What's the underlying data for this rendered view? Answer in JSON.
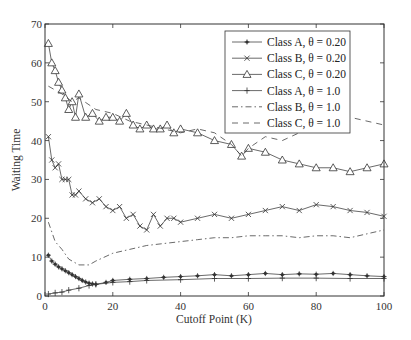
{
  "chart_data": {
    "type": "line",
    "title": "",
    "xlabel": "Cutoff Point (K)",
    "ylabel": "Waiting Time",
    "xlim": [
      0,
      100
    ],
    "ylim": [
      0,
      70
    ],
    "xticks": [
      0,
      20,
      40,
      60,
      80,
      100
    ],
    "yticks": [
      0,
      10,
      20,
      30,
      40,
      50,
      60,
      70
    ],
    "grid": false,
    "legend_position": "upper right (inside)",
    "series": [
      {
        "name": "Class A, θ = 0.20",
        "marker": "asterisk",
        "linestyle": "solid",
        "x": [
          1,
          2,
          3,
          4,
          5,
          6,
          7,
          8,
          9,
          10,
          11,
          12,
          13,
          14,
          15,
          18,
          20,
          25,
          30,
          35,
          40,
          45,
          50,
          55,
          60,
          65,
          70,
          75,
          80,
          85,
          90,
          95,
          100
        ],
        "values": [
          10.5,
          9,
          8.2,
          7.5,
          7,
          6.5,
          6,
          5.5,
          5,
          4.5,
          4,
          3.6,
          3.3,
          3.1,
          3,
          3.5,
          4,
          4.3,
          4.5,
          4.8,
          5,
          5.2,
          5.5,
          5.2,
          5.5,
          5.8,
          5.5,
          5.7,
          5.6,
          5.8,
          5.5,
          5.2,
          5
        ]
      },
      {
        "name": "Class B, θ = 0.20",
        "marker": "x",
        "linestyle": "solid",
        "x": [
          1,
          2,
          3,
          4,
          5,
          6,
          7,
          8,
          9,
          10,
          12,
          14,
          16,
          18,
          20,
          22,
          24,
          26,
          28,
          30,
          32,
          34,
          36,
          38,
          40,
          45,
          50,
          55,
          60,
          65,
          70,
          75,
          80,
          85,
          90,
          95,
          100
        ],
        "values": [
          41,
          35,
          33,
          34,
          30,
          30,
          30,
          26,
          26,
          27,
          25,
          24,
          25,
          23,
          22,
          23,
          20,
          21,
          18,
          17,
          21,
          18,
          20,
          20,
          19,
          20,
          21,
          20,
          21,
          22,
          23,
          22,
          23.5,
          23,
          22,
          21.5,
          20.5
        ]
      },
      {
        "name": "Class C, θ = 0.20",
        "marker": "triangle",
        "linestyle": "solid",
        "x": [
          1,
          2,
          3,
          4,
          5,
          6,
          7,
          8,
          9,
          10,
          12,
          14,
          16,
          18,
          20,
          22,
          24,
          26,
          28,
          30,
          32,
          34,
          36,
          38,
          40,
          45,
          50,
          55,
          58,
          60,
          65,
          70,
          75,
          80,
          85,
          90,
          95,
          100
        ],
        "values": [
          65,
          60,
          58,
          55,
          53,
          51,
          48,
          50,
          46,
          52,
          46,
          47,
          45,
          46,
          46,
          45,
          47,
          44,
          43,
          44,
          43,
          43,
          44,
          42,
          43,
          42,
          40,
          39,
          36,
          38,
          37,
          35,
          34,
          33,
          33,
          32,
          33,
          34
        ]
      },
      {
        "name": "Class A, θ = 1.0",
        "marker": "plus",
        "linestyle": "solid",
        "x": [
          1,
          3,
          5,
          7,
          10,
          13,
          15,
          20,
          25,
          30,
          40,
          50,
          60,
          70,
          80,
          90,
          100
        ],
        "values": [
          0.5,
          0.8,
          1,
          1.5,
          2,
          2.7,
          3,
          3.5,
          3.7,
          4,
          4.2,
          4.5,
          4.5,
          4.6,
          4.6,
          4.5,
          4.5
        ]
      },
      {
        "name": "Class B, θ = 1.0",
        "marker": "none",
        "linestyle": "dashdot",
        "x": [
          1,
          3,
          5,
          7,
          10,
          13,
          15,
          20,
          25,
          30,
          35,
          40,
          45,
          50,
          55,
          60,
          65,
          70,
          75,
          80,
          85,
          90,
          95,
          100
        ],
        "values": [
          19,
          14,
          12,
          9.5,
          8,
          8,
          9,
          11,
          12,
          13,
          13.5,
          14,
          14.5,
          15,
          15,
          15.5,
          15.5,
          15.5,
          15,
          15.5,
          15.5,
          15,
          16,
          17
        ]
      },
      {
        "name": "Class C, θ = 1.0",
        "marker": "none",
        "linestyle": "dashed",
        "x": [
          1,
          3,
          5,
          8,
          10,
          15,
          20,
          25,
          30,
          35,
          40,
          45,
          50,
          55,
          58,
          60,
          65,
          70,
          75,
          80,
          85,
          90,
          95,
          100
        ],
        "values": [
          54,
          53,
          52,
          50,
          51,
          48,
          47,
          45,
          44,
          43,
          42,
          43,
          42,
          39,
          36,
          38,
          41,
          40,
          42,
          43,
          44,
          46,
          45,
          44
        ]
      }
    ]
  }
}
